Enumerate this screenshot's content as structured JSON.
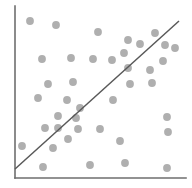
{
  "figure": {
    "name": "scatter-plot-with-trend-line",
    "background_color": "#ffffff",
    "width": 192,
    "height": 188
  },
  "chart_data": {
    "type": "scatter",
    "title": "",
    "subtitle": "",
    "xlabel": "",
    "ylabel": "",
    "grid": false,
    "legend": null,
    "xlim": [
      0,
      100
    ],
    "ylim": [
      0,
      100
    ],
    "axis": {
      "color": "#6e6e6e",
      "width": 1.6,
      "origin_px": [
        15,
        178
      ],
      "y_axis_top_px": [
        15,
        6
      ],
      "x_axis_right_px": [
        186,
        178
      ],
      "ticks": [],
      "tick_labels": []
    },
    "point_style": {
      "color": "#afafaf",
      "radius_px": 3.9,
      "marker": "circle"
    },
    "trend_line": {
      "label": "",
      "color": "#595959",
      "width": 1.5,
      "start_px": [
        15,
        169
      ],
      "end_px": [
        179,
        21
      ],
      "slope_px": -0.902,
      "x_start": 0,
      "y_start": 5,
      "x_end": 96,
      "y_end": 91
    },
    "n_points": 40,
    "x": [
      9,
      24,
      48,
      66,
      73,
      82,
      88,
      16,
      33,
      46,
      57,
      64,
      87,
      94,
      66,
      78,
      20,
      34,
      68,
      80,
      14,
      30,
      57,
      53,
      24,
      34,
      90,
      23,
      26,
      37,
      50,
      41,
      89,
      63,
      4,
      23,
      27,
      44,
      62,
      89
    ],
    "y": [
      91,
      89,
      83,
      78,
      76,
      81,
      73,
      69,
      70,
      69,
      68,
      73,
      65,
      74,
      61,
      60,
      57,
      58,
      55,
      57,
      52,
      48,
      52,
      46,
      43,
      42,
      44,
      34,
      33,
      33,
      34,
      28,
      35,
      26,
      21,
      20,
      13,
      14,
      15,
      11
    ],
    "points_px": [
      {
        "x": 30,
        "y": 21
      },
      {
        "x": 56,
        "y": 25
      },
      {
        "x": 98,
        "y": 32
      },
      {
        "x": 128,
        "y": 40
      },
      {
        "x": 140,
        "y": 44
      },
      {
        "x": 155,
        "y": 33
      },
      {
        "x": 165,
        "y": 45
      },
      {
        "x": 42,
        "y": 59
      },
      {
        "x": 71,
        "y": 58
      },
      {
        "x": 93,
        "y": 59
      },
      {
        "x": 112,
        "y": 60
      },
      {
        "x": 124,
        "y": 53
      },
      {
        "x": 163,
        "y": 61
      },
      {
        "x": 175,
        "y": 48
      },
      {
        "x": 128,
        "y": 68
      },
      {
        "x": 150,
        "y": 70
      },
      {
        "x": 48,
        "y": 84
      },
      {
        "x": 73,
        "y": 82
      },
      {
        "x": 130,
        "y": 84
      },
      {
        "x": 152,
        "y": 83
      },
      {
        "x": 38,
        "y": 98
      },
      {
        "x": 67,
        "y": 100
      },
      {
        "x": 113,
        "y": 100
      },
      {
        "x": 80,
        "y": 108
      },
      {
        "x": 58,
        "y": 116
      },
      {
        "x": 76,
        "y": 118
      },
      {
        "x": 167,
        "y": 117
      },
      {
        "x": 45,
        "y": 128
      },
      {
        "x": 58,
        "y": 128
      },
      {
        "x": 78,
        "y": 129
      },
      {
        "x": 100,
        "y": 129
      },
      {
        "x": 68,
        "y": 139
      },
      {
        "x": 168,
        "y": 132
      },
      {
        "x": 120,
        "y": 141
      },
      {
        "x": 22,
        "y": 146
      },
      {
        "x": 53,
        "y": 148
      },
      {
        "x": 43,
        "y": 167
      },
      {
        "x": 90,
        "y": 165
      },
      {
        "x": 125,
        "y": 163
      },
      {
        "x": 167,
        "y": 168
      }
    ]
  }
}
